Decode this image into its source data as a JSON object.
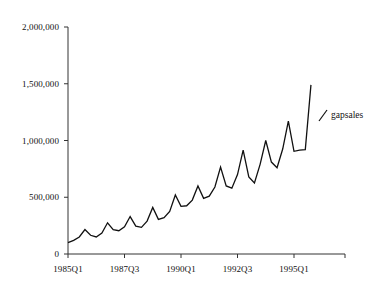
{
  "chart_data": {
    "type": "line",
    "title": "",
    "xlabel": "",
    "ylabel": "",
    "grid": false,
    "legend_position": "right",
    "ylim": [
      0,
      2000000
    ],
    "ytick_values": [
      2000000,
      1500000,
      1000000,
      500000,
      0
    ],
    "ytick_labels": [
      "2,000,000",
      "1,500,000",
      "1,000,000",
      "500,000",
      "0"
    ],
    "xtick_labels": [
      "1985Q1",
      "1987Q3",
      "1990Q1",
      "1992Q3",
      "1995Q1"
    ],
    "xtick_index": [
      0,
      10,
      20,
      30,
      40
    ],
    "x": [
      "1985Q1",
      "1985Q2",
      "1985Q3",
      "1985Q4",
      "1986Q1",
      "1986Q2",
      "1986Q3",
      "1986Q4",
      "1987Q1",
      "1987Q2",
      "1987Q3",
      "1987Q4",
      "1988Q1",
      "1988Q2",
      "1988Q3",
      "1988Q4",
      "1989Q1",
      "1989Q2",
      "1989Q3",
      "1989Q4",
      "1990Q1",
      "1990Q2",
      "1990Q3",
      "1990Q4",
      "1991Q1",
      "1991Q2",
      "1991Q3",
      "1991Q4",
      "1992Q1",
      "1992Q2",
      "1992Q3",
      "1992Q4",
      "1993Q1",
      "1993Q2",
      "1993Q3",
      "1993Q4",
      "1994Q1",
      "1994Q2",
      "1994Q3",
      "1994Q4",
      "1995Q1",
      "1995Q2",
      "1995Q3",
      "1995Q4"
    ],
    "series": [
      {
        "name": "gapsales",
        "color": "#111111",
        "values": [
          100000,
          120000,
          150000,
          215000,
          165000,
          150000,
          185000,
          275000,
          215000,
          205000,
          240000,
          330000,
          245000,
          235000,
          290000,
          410000,
          305000,
          320000,
          375000,
          520000,
          420000,
          425000,
          475000,
          600000,
          490000,
          510000,
          590000,
          765000,
          600000,
          580000,
          700000,
          915000,
          680000,
          625000,
          790000,
          1000000,
          810000,
          760000,
          925000,
          1170000,
          905000,
          915000,
          920000,
          1490000
        ]
      }
    ],
    "legend": [
      {
        "label": "gapsales",
        "marker": "line-diagonal",
        "color": "#111111"
      }
    ]
  },
  "geometry": {
    "plot_left": 68,
    "plot_right": 345,
    "plot_top": 27,
    "plot_bottom": 254,
    "quarter_width": 5.65,
    "y_per_unit": 0.0001135
  },
  "legend_entry": {
    "label": "gapsales"
  }
}
